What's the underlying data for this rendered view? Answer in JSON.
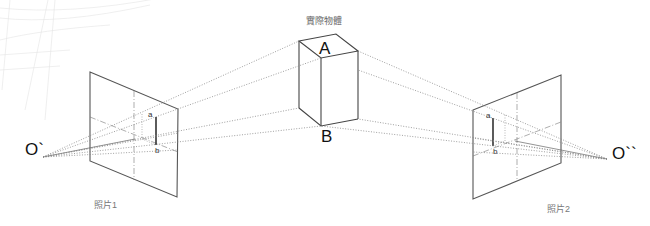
{
  "title": "實際物體",
  "object": {
    "top_label": "A",
    "bottom_label": "B"
  },
  "left_view": {
    "origin_label": "O`",
    "point_a": "a",
    "point_b": "b",
    "caption": "照片1"
  },
  "right_view": {
    "origin_label": "O``",
    "point_a": "a",
    "point_b": "b",
    "caption": "照片2"
  },
  "colors": {
    "line": "#555555",
    "dotted": "#888888",
    "caption": "#777777"
  }
}
